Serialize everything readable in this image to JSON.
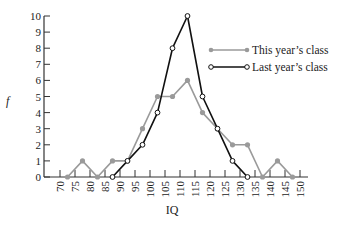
{
  "chart_data": {
    "type": "line",
    "title": "",
    "xlabel": "IQ",
    "ylabel": "f",
    "x_ticks": [
      70,
      75,
      80,
      85,
      90,
      95,
      100,
      105,
      110,
      115,
      120,
      125,
      130,
      135,
      140,
      145,
      150
    ],
    "y_ticks": [
      0,
      1,
      2,
      3,
      4,
      5,
      6,
      7,
      8,
      9,
      10
    ],
    "xlim": [
      70,
      150
    ],
    "ylim": [
      0,
      10
    ],
    "grid": false,
    "legend_position": "upper right",
    "series": [
      {
        "name": "This year's class",
        "color": "#9a9a9a",
        "marker": "filled-circle",
        "x": [
          72.5,
          77.5,
          82.5,
          87.5,
          92.5,
          97.5,
          102.5,
          107.5,
          112.5,
          117.5,
          122.5,
          127.5,
          132.5,
          137.5,
          142.5,
          147.5
        ],
        "values": [
          0,
          1,
          0,
          1,
          1,
          3,
          5,
          5,
          6,
          4,
          3,
          2,
          2,
          0,
          1,
          0
        ]
      },
      {
        "name": "Last year's class",
        "color": "#111111",
        "marker": "open-circle",
        "x": [
          87.5,
          92.5,
          97.5,
          102.5,
          107.5,
          112.5,
          117.5,
          122.5,
          127.5,
          132.5
        ],
        "values": [
          0,
          1,
          2,
          4,
          8,
          10,
          5,
          3,
          1,
          0
        ]
      }
    ]
  },
  "legend": {
    "this_year": "This year’s class",
    "last_year": "Last year’s class"
  },
  "axes": {
    "xlabel": "IQ",
    "ylabel": "f"
  }
}
